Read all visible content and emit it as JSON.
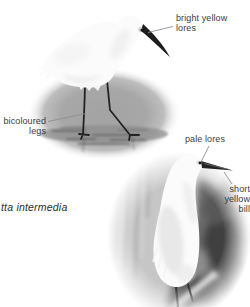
{
  "caption": {
    "species_partial": "tta intermedia"
  },
  "top_figure": {
    "description": "egret standing in shallow water, oval vignette",
    "label_lores": {
      "line1": "bright yellow",
      "line2": "lores"
    },
    "label_legs": {
      "line1": "bicoloured",
      "line2": "legs"
    }
  },
  "bottom_figure": {
    "description": "egret portrait against rocks, oval vignette",
    "label_pale_lores": {
      "line1": "pale lores"
    },
    "label_bill": {
      "line1": "short",
      "line2": "yellow",
      "line3": "bill"
    }
  },
  "colors": {
    "page_bg": "#ffffff",
    "label_text": "#3d3d3d",
    "caption_text": "#2d2d2d",
    "leader_line": "#8f8f8f",
    "vignette_gray": "#a6a6a6",
    "water_band": "#6f6f6f",
    "rock_dark": "#454545",
    "bird_white": "#fbfbfb",
    "bill_dark": "#1d1d1d"
  }
}
